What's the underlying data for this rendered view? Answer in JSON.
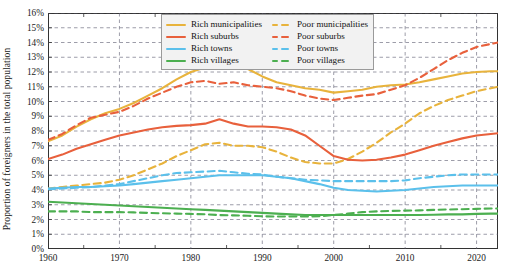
{
  "chart_data": {
    "type": "line",
    "title": "",
    "xlabel": "",
    "ylabel": "Proportion of foreigners in the total population",
    "xlim": [
      1960,
      2023
    ],
    "ylim": [
      0,
      16
    ],
    "grid": true,
    "legend_position": "top-center",
    "xticks": [
      1960,
      1970,
      1980,
      1990,
      2000,
      2010,
      2020
    ],
    "xtick_labels": [
      "1960",
      "1970",
      "1980",
      "1990",
      "2000",
      "2010",
      "2020"
    ],
    "xminorticks": [
      1965,
      1975,
      1985,
      1995,
      2005,
      2015
    ],
    "yticks": [
      0,
      1,
      2,
      3,
      4,
      5,
      6,
      7,
      8,
      9,
      10,
      11,
      12,
      13,
      14,
      15,
      16
    ],
    "ytick_labels": [
      "0%",
      "1%",
      "2%",
      "3%",
      "4%",
      "5%",
      "6%",
      "7%",
      "8%",
      "9%",
      "10%",
      "11%",
      "12%",
      "13%",
      "14%",
      "15%",
      "16%"
    ],
    "x": [
      1960,
      1962,
      1964,
      1966,
      1968,
      1970,
      1972,
      1974,
      1976,
      1978,
      1980,
      1982,
      1984,
      1986,
      1988,
      1990,
      1992,
      1994,
      1996,
      1998,
      2000,
      2002,
      2004,
      2006,
      2008,
      2010,
      2012,
      2014,
      2016,
      2018,
      2020,
      2022,
      2023
    ],
    "series": [
      {
        "name": "Rich municipalities",
        "color": "#E8B33C",
        "style": "solid",
        "values": [
          7.3,
          7.7,
          8.3,
          8.8,
          9.2,
          9.5,
          9.9,
          10.4,
          10.9,
          11.5,
          12.0,
          12.3,
          12.4,
          12.35,
          12.2,
          11.7,
          11.3,
          11.1,
          10.9,
          10.8,
          10.6,
          10.7,
          10.8,
          11.0,
          11.1,
          11.15,
          11.3,
          11.5,
          11.7,
          11.9,
          12.0,
          12.05,
          12.05
        ]
      },
      {
        "name": "Poor municipalities",
        "color": "#E8B33C",
        "style": "dashed",
        "values": [
          4.1,
          4.2,
          4.3,
          4.4,
          4.5,
          4.7,
          5.0,
          5.4,
          5.8,
          6.3,
          6.7,
          7.1,
          7.2,
          7.0,
          7.0,
          6.9,
          6.6,
          6.2,
          5.9,
          5.8,
          5.8,
          6.1,
          6.6,
          7.2,
          7.9,
          8.5,
          9.2,
          9.7,
          10.1,
          10.4,
          10.7,
          10.9,
          11.0
        ]
      },
      {
        "name": "Rich suburbs",
        "color": "#E8603C",
        "style": "solid",
        "values": [
          6.1,
          6.4,
          6.8,
          7.1,
          7.4,
          7.7,
          7.9,
          8.1,
          8.25,
          8.35,
          8.4,
          8.5,
          8.8,
          8.5,
          8.3,
          8.3,
          8.25,
          8.1,
          7.7,
          7.0,
          6.3,
          6.05,
          6.0,
          6.05,
          6.2,
          6.4,
          6.7,
          7.0,
          7.25,
          7.5,
          7.7,
          7.8,
          7.85
        ]
      },
      {
        "name": "Poor suburbs",
        "color": "#E8603C",
        "style": "dashed",
        "values": [
          7.4,
          7.8,
          8.4,
          8.9,
          9.1,
          9.3,
          9.7,
          10.2,
          10.6,
          11.0,
          11.3,
          11.4,
          11.2,
          11.3,
          11.1,
          11.0,
          10.9,
          10.7,
          10.4,
          10.2,
          10.1,
          10.25,
          10.4,
          10.5,
          10.8,
          11.1,
          11.6,
          12.2,
          12.8,
          13.3,
          13.7,
          13.9,
          14.0
        ]
      },
      {
        "name": "Rich towns",
        "color": "#5BC0EB",
        "style": "solid",
        "values": [
          4.1,
          4.15,
          4.2,
          4.2,
          4.25,
          4.3,
          4.4,
          4.5,
          4.6,
          4.7,
          4.8,
          4.9,
          5.0,
          5.0,
          5.0,
          5.0,
          4.9,
          4.8,
          4.6,
          4.4,
          4.15,
          4.0,
          3.95,
          3.9,
          3.95,
          4.0,
          4.1,
          4.2,
          4.25,
          4.3,
          4.3,
          4.3,
          4.3
        ]
      },
      {
        "name": "Poor towns",
        "color": "#5BC0EB",
        "style": "dashed",
        "values": [
          4.05,
          4.1,
          4.15,
          4.2,
          4.3,
          4.4,
          4.6,
          4.8,
          5.0,
          5.15,
          5.2,
          5.25,
          5.3,
          5.2,
          5.1,
          5.05,
          4.9,
          4.8,
          4.7,
          4.65,
          4.6,
          4.6,
          4.6,
          4.6,
          4.6,
          4.65,
          4.8,
          4.9,
          5.0,
          5.05,
          5.05,
          5.05,
          5.05
        ]
      },
      {
        "name": "Rich villages",
        "color": "#4CAF50",
        "style": "solid",
        "values": [
          3.2,
          3.15,
          3.1,
          3.05,
          3.0,
          2.95,
          2.9,
          2.85,
          2.8,
          2.75,
          2.7,
          2.65,
          2.6,
          2.55,
          2.5,
          2.45,
          2.4,
          2.35,
          2.3,
          2.3,
          2.3,
          2.3,
          2.3,
          2.3,
          2.3,
          2.3,
          2.3,
          2.32,
          2.35,
          2.35,
          2.38,
          2.4,
          2.4
        ]
      },
      {
        "name": "Poor villages",
        "color": "#4CAF50",
        "style": "dashed",
        "values": [
          2.55,
          2.55,
          2.55,
          2.5,
          2.5,
          2.5,
          2.48,
          2.45,
          2.42,
          2.4,
          2.38,
          2.35,
          2.3,
          2.28,
          2.25,
          2.22,
          2.2,
          2.2,
          2.2,
          2.22,
          2.3,
          2.4,
          2.5,
          2.55,
          2.58,
          2.6,
          2.62,
          2.65,
          2.68,
          2.7,
          2.72,
          2.75,
          2.75
        ]
      }
    ]
  },
  "legend": {
    "items": [
      {
        "label": "Rich municipalities"
      },
      {
        "label": "Poor municipalities"
      },
      {
        "label": "Rich suburbs"
      },
      {
        "label": "Poor suburbs"
      },
      {
        "label": "Rich towns"
      },
      {
        "label": "Poor towns"
      },
      {
        "label": "Rich villages"
      },
      {
        "label": "Poor villages"
      }
    ]
  }
}
